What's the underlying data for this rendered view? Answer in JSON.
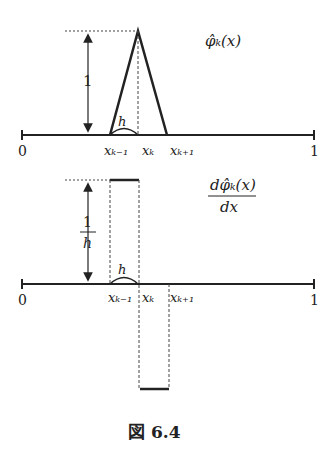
{
  "top": {
    "function_label": "φ̂ₖ(x)",
    "height_label": "1",
    "width_label": "h",
    "axis_start": "0",
    "axis_end": "1",
    "x_labels": [
      "xₖ₋₁",
      "xₖ",
      "xₖ₊₁"
    ]
  },
  "bottom": {
    "numerator": "dφ̂ₖ(x)",
    "denominator": "dx",
    "height_num": "1",
    "height_den": "h",
    "width_label": "h",
    "axis_start": "0",
    "axis_end": "1",
    "x_labels": [
      "xₖ₋₁",
      "xₖ",
      "xₖ₊₁"
    ]
  },
  "caption": "図 6.4"
}
